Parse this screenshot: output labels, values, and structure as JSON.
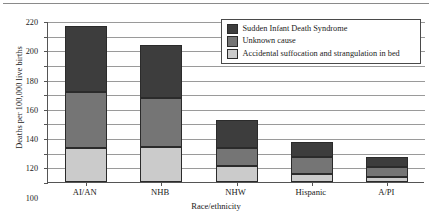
{
  "chart_data": {
    "type": "bar",
    "stacked": true,
    "title": "",
    "xlabel": "Race/ethnicity",
    "ylabel": "Deaths per 100,000 live births",
    "categories": [
      "AI/AN",
      "NHB",
      "NHW",
      "Hispanic",
      "A/PI"
    ],
    "series": [
      {
        "name": "Accidental suffocation and strangulation in bed",
        "color": "#cbcbcb",
        "values": [
          47,
          48,
          22,
          11,
          7
        ]
      },
      {
        "name": "Unknown cause",
        "color": "#757575",
        "values": [
          76,
          67,
          25,
          23,
          13
        ]
      },
      {
        "name": "Sudden Infant Death Syndrome",
        "color": "#3d3d3d",
        "values": [
          90,
          72,
          38,
          21,
          14
        ]
      }
    ],
    "totals": [
      213,
      187,
      85,
      55,
      34
    ],
    "ylim": [
      0,
      220
    ],
    "yticks": [
      0,
      20,
      40,
      60,
      80,
      100,
      120,
      140,
      160,
      180,
      200,
      220
    ],
    "grid": true,
    "legend_position": "top-right",
    "legend_entries": [
      "Sudden Infant Death Syndrome",
      "Unknown cause",
      "Accidental suffocation and strangulation in bed"
    ]
  }
}
